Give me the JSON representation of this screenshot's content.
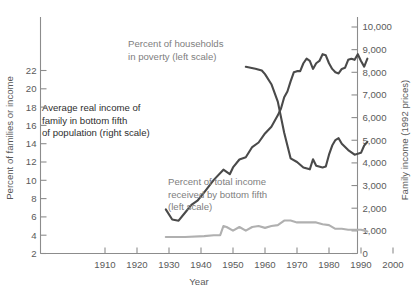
{
  "chart_data": {
    "type": "line",
    "title": "",
    "xlabel": "Year",
    "ylabel": "Percent of families or income",
    "ylabel_right": "Family income (1992 prices)",
    "xlim": [
      1902,
      2002
    ],
    "ylim": [
      1,
      23
    ],
    "ylim_right": [
      0,
      10450
    ],
    "grid": false,
    "legend": "inline annotations",
    "xticks": [
      1910,
      1920,
      1930,
      1940,
      1950,
      1960,
      1970,
      1980,
      1990,
      2000
    ],
    "xtick_labels": [
      "1910",
      "1920",
      "1930",
      "1940",
      "1950",
      "1960",
      "1970",
      "1980",
      "1990",
      "2000"
    ],
    "yticks_left": [
      2,
      4,
      6,
      8,
      10,
      12,
      14,
      16,
      18,
      20,
      22
    ],
    "ytick_labels_left": [
      "2",
      "4",
      "6",
      "8",
      "10",
      "12",
      "14",
      "16",
      "18",
      "20",
      "22"
    ],
    "yticks_right": [
      0,
      1000,
      2000,
      3000,
      4000,
      5000,
      6000,
      7000,
      8000,
      9000,
      10000
    ],
    "ytick_labels_right": [
      "0",
      "1,000",
      "2,000",
      "3,000",
      "4,000",
      "5,000",
      "6,000",
      "7,000",
      "8,000",
      "9,000",
      "10,000"
    ],
    "colors": {
      "dark_series": "#4a4a4a",
      "light_series": "#b0b0b0",
      "axis": "#8c8c8c",
      "annotation_grey": "#808080",
      "annotation_dark": "#2e2e2e",
      "background": "#ffffff"
    },
    "annotations": [
      {
        "name": "poverty-label",
        "lines": [
          "Percent of households",
          "in poverty (left scale)"
        ],
        "color": "#808080",
        "x": 128,
        "y": 47
      },
      {
        "name": "income-label",
        "lines": [
          "Average real income of",
          "family in bottom fifth",
          "of population (right scale)"
        ],
        "color": "#2e2e2e",
        "x": 42,
        "y": 111
      },
      {
        "name": "share-label",
        "lines": [
          "Percent of total income",
          "received by bottom fifth",
          "(left scale)"
        ],
        "color": "#808080",
        "x": 168,
        "y": 185
      }
    ],
    "series": [
      {
        "name": "Average real income of family in bottom fifth of population",
        "axis": "right",
        "color": "#4a4a4a",
        "units": "1992 dollars",
        "x": [
          1929,
          1931,
          1933,
          1935,
          1937,
          1939,
          1941,
          1944,
          1947,
          1949,
          1950,
          1952,
          1954,
          1956,
          1958,
          1960,
          1962,
          1964,
          1965,
          1966,
          1967,
          1968,
          1969,
          1970,
          1971,
          1972,
          1973,
          1974,
          1975,
          1976,
          1977,
          1978,
          1979,
          1980,
          1981,
          1982,
          1983,
          1984,
          1985,
          1986,
          1987,
          1988,
          1989,
          1990,
          1991,
          1992
        ],
        "values": [
          1950,
          1500,
          1450,
          1800,
          2150,
          2350,
          2700,
          3250,
          3700,
          3500,
          3800,
          4150,
          4250,
          4700,
          4900,
          5300,
          5600,
          6100,
          6400,
          6900,
          7150,
          7600,
          8000,
          8050,
          8050,
          8400,
          8600,
          8500,
          8150,
          8400,
          8500,
          8800,
          8750,
          8400,
          8150,
          8000,
          7950,
          8150,
          8200,
          8550,
          8600,
          8550,
          8800,
          8500,
          8250,
          8600
        ]
      },
      {
        "name": "Percent of households in poverty",
        "axis": "left",
        "color": "#4a4a4a",
        "units": "percent",
        "x": [
          1954,
          1957,
          1959,
          1960,
          1962,
          1964,
          1966,
          1968,
          1970,
          1972,
          1974,
          1975,
          1976,
          1978,
          1979,
          1980,
          1981,
          1982,
          1983,
          1984,
          1986,
          1988,
          1990,
          1991,
          1992
        ],
        "values": [
          22.4,
          22.2,
          22.0,
          21.6,
          20.5,
          18.6,
          15.2,
          12.4,
          12.0,
          11.4,
          11.2,
          12.3,
          11.6,
          11.4,
          11.5,
          12.8,
          13.8,
          14.4,
          14.6,
          14.0,
          13.3,
          12.8,
          13.0,
          13.8,
          14.2
        ]
      },
      {
        "name": "Percent of total income received by bottom fifth",
        "axis": "left",
        "color": "#b0b0b0",
        "units": "percent",
        "x": [
          1929,
          1935,
          1941,
          1944,
          1946,
          1947,
          1948,
          1950,
          1952,
          1954,
          1956,
          1958,
          1960,
          1962,
          1964,
          1966,
          1968,
          1970,
          1972,
          1974,
          1976,
          1978,
          1980,
          1982,
          1984,
          1986,
          1988,
          1990,
          1992
        ],
        "values": [
          3.8,
          3.8,
          3.9,
          4.0,
          4.0,
          5.0,
          4.9,
          4.5,
          4.9,
          4.5,
          4.9,
          5.0,
          4.8,
          5.0,
          5.1,
          5.6,
          5.6,
          5.4,
          5.4,
          5.4,
          5.4,
          5.2,
          5.1,
          4.7,
          4.7,
          4.6,
          4.6,
          4.6,
          4.4
        ]
      }
    ]
  },
  "axes": {
    "x_title": "Year",
    "y_left_title": "Percent of families or income",
    "y_right_title": "Family income (1992 prices)"
  }
}
